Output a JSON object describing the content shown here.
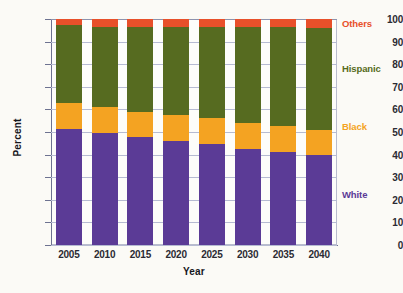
{
  "chart_data": {
    "type": "bar",
    "subtype": "stacked-100-percent",
    "title": "",
    "xlabel": "Year",
    "ylabel": "Percent",
    "ylim": [
      0,
      100
    ],
    "ytick_step": 10,
    "yticks": [
      0,
      10,
      20,
      30,
      40,
      50,
      60,
      70,
      80,
      90,
      100
    ],
    "ytick_labels": [
      "0",
      "10",
      "20",
      "30",
      "40",
      "50",
      "60",
      "70",
      "80",
      "90",
      "100"
    ],
    "categories": [
      "2005",
      "2010",
      "2015",
      "2020",
      "2025",
      "2030",
      "2035",
      "2040"
    ],
    "grid": true,
    "grid_axis": "y",
    "legend_position": "right-inline",
    "stack_order_bottom_to_top": [
      "White",
      "Black",
      "Hispanic",
      "Others"
    ],
    "series": [
      {
        "name": "White",
        "color": "#5B3B96",
        "legend_y_percent": 22,
        "values": [
          51.5,
          49.5,
          48.0,
          46.0,
          44.5,
          42.5,
          41.0,
          40.0
        ]
      },
      {
        "name": "Black",
        "color": "#F4A322",
        "legend_y_percent": 52,
        "values": [
          11.5,
          11.5,
          11.0,
          11.5,
          11.5,
          11.5,
          11.5,
          11.0
        ]
      },
      {
        "name": "Hispanic",
        "color": "#566B20",
        "legend_y_percent": 78,
        "values": [
          34.5,
          35.5,
          37.5,
          39.0,
          40.5,
          42.5,
          44.0,
          45.0
        ]
      },
      {
        "name": "Others",
        "color": "#E8502A",
        "legend_y_percent": 98,
        "values": [
          2.5,
          3.5,
          3.5,
          3.5,
          3.5,
          3.5,
          3.5,
          4.0
        ]
      }
    ],
    "cumulative_tops": {
      "white": [
        51.5,
        49.5,
        48.0,
        46.0,
        44.5,
        42.5,
        41.0,
        40.0
      ],
      "black": [
        63.0,
        61.0,
        59.0,
        57.5,
        56.0,
        54.0,
        52.5,
        51.0
      ],
      "hispanic": [
        97.5,
        96.5,
        96.5,
        96.5,
        96.5,
        96.5,
        96.5,
        96.0
      ],
      "others": [
        100,
        100,
        100,
        100,
        100,
        100,
        100,
        100
      ]
    },
    "colors": {
      "white": "#5B3B96",
      "black": "#F4A322",
      "hispanic": "#566B20",
      "others": "#E8502A",
      "gridline": "#b6bbd2",
      "axis": "#6d7290",
      "background": "#fbfaf6",
      "text": "#2b2b33"
    }
  }
}
